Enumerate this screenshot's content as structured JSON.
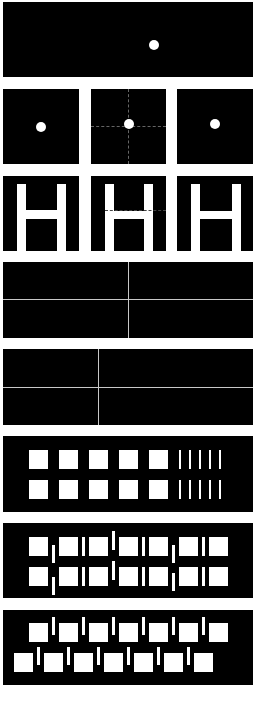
{
  "figure": {
    "colors": {
      "background": "#ffffff",
      "panel": "#000000",
      "element": "#ffffff",
      "divider": "#c8c8c8",
      "crosshair": "#666666"
    },
    "panels": [
      {
        "id": 1,
        "type": "wide-dot",
        "dot": {
          "x": 154,
          "y": 45
        }
      },
      {
        "id": 2,
        "type": "square-dots",
        "squares": [
          {
            "dot_offset": "center-left-low",
            "crosshair": false
          },
          {
            "dot_offset": "center",
            "crosshair": true
          },
          {
            "dot_offset": "center-right",
            "crosshair": false
          }
        ]
      },
      {
        "id": 3,
        "type": "letter-H",
        "count": 3,
        "middle_has_dashed_line": true
      },
      {
        "id": 4,
        "type": "grid-2x2",
        "vertical_divider_frac": 0.5
      },
      {
        "id": 5,
        "type": "grid-2x2",
        "vertical_divider_frac": 0.38
      },
      {
        "id": 6,
        "type": "squares-and-lines",
        "squares_per_row": 5,
        "lines_per_row": 5,
        "rows": 2
      },
      {
        "id": 7,
        "type": "squares-with-offset-bars",
        "squares_per_row": 7,
        "rows": 2,
        "bar_offsets": [
          "low",
          "mid",
          "high",
          "mid",
          "low",
          "mid"
        ]
      },
      {
        "id": 8,
        "type": "staggered-squares-bars",
        "squares_per_row": 7,
        "rows": 2,
        "bottom_row_shift": -15
      }
    ]
  }
}
